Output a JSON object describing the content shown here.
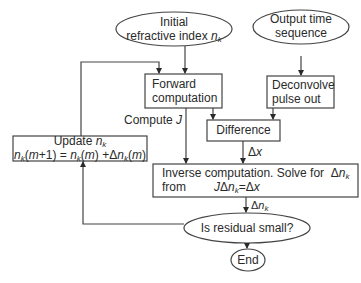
{
  "diagram": {
    "type": "flowchart",
    "nodes": {
      "initial": {
        "shape": "ellipse",
        "line1": "Initial",
        "line2": "refractive index",
        "symbol": "n",
        "sub": "k"
      },
      "output": {
        "shape": "ellipse",
        "line1": "Output time",
        "line2": "sequence"
      },
      "forward": {
        "shape": "box",
        "line1": "Forward",
        "line2": "computation"
      },
      "deconvolve": {
        "shape": "box",
        "line1": "Deconvolve",
        "line2": "pulse out"
      },
      "difference": {
        "shape": "box",
        "label": "Difference"
      },
      "update": {
        "shape": "box",
        "line1": "Update",
        "line1_symbol": "n",
        "line1_sub": "k",
        "equation": "n_k(m+1) = n_k(m) + Δn_k(m)"
      },
      "inverse": {
        "shape": "box",
        "line1": "Inverse computation. Solve for",
        "line1_symbol": "Δn_k",
        "line2_prefix": "from",
        "equation": "JΔn_k=Δx"
      },
      "residual": {
        "shape": "ellipse",
        "label": "Is residual small?"
      },
      "end": {
        "shape": "ellipse",
        "label": "End"
      }
    },
    "edge_labels": {
      "compute_j": "Compute",
      "compute_j_symbol": "J",
      "delta_x": "Δx",
      "delta_nk": "Δn_k"
    },
    "edges": [
      [
        "initial",
        "forward"
      ],
      [
        "output",
        "deconvolve"
      ],
      [
        "forward",
        "difference"
      ],
      [
        "deconvolve",
        "difference"
      ],
      [
        "forward",
        "inverse",
        "Compute J"
      ],
      [
        "difference",
        "inverse",
        "Δx"
      ],
      [
        "inverse",
        "residual",
        "Δn_k"
      ],
      [
        "residual",
        "end"
      ],
      [
        "residual",
        "update"
      ],
      [
        "update",
        "forward"
      ]
    ]
  }
}
